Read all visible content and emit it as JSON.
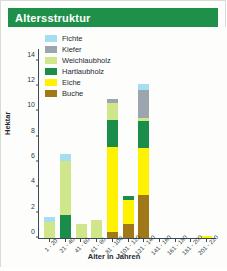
{
  "banner": {
    "title": "Altersstruktur"
  },
  "chart_data": {
    "type": "bar",
    "subtype": "stacked",
    "title": "Altersstruktur",
    "xlabel": "Alter in Jahren",
    "ylabel": "Hektar",
    "ylim": [
      0,
      15
    ],
    "yticks": [
      0,
      2,
      4,
      6,
      8,
      10,
      12,
      14
    ],
    "grid": false,
    "legend_position": "top-left-inside",
    "categories": [
      "1 - 20",
      "21 - 40",
      "41 - 60",
      "61 - 80",
      "81 - 100",
      "101 - 120",
      "121 - 140",
      "141 - 160",
      "161 - 180",
      "181 - 200",
      "201 - 220"
    ],
    "series": [
      {
        "name": "Buche",
        "color": "#a07818",
        "values": [
          0,
          0,
          0,
          0,
          0.5,
          1.1,
          3.4,
          0,
          0,
          0,
          0
        ]
      },
      {
        "name": "Eiche",
        "color": "#fff200",
        "values": [
          0,
          0,
          0,
          0,
          6.7,
          1.9,
          3.7,
          0,
          0,
          0,
          0.15
        ]
      },
      {
        "name": "Hartlaubholz",
        "color": "#1a8d4a",
        "values": [
          0,
          1.8,
          0,
          0,
          2.1,
          0.3,
          2.1,
          0,
          0,
          0,
          0
        ]
      },
      {
        "name": "Weichlaubholz",
        "color": "#cfe68a",
        "values": [
          1.3,
          4.3,
          1.1,
          1.4,
          1.4,
          0,
          0.3,
          0,
          0,
          0,
          0
        ]
      },
      {
        "name": "Kiefer",
        "color": "#9aa5ad",
        "values": [
          0,
          0,
          0,
          0,
          0.25,
          0,
          2.2,
          0,
          0,
          0,
          0
        ]
      },
      {
        "name": "Fichte",
        "color": "#a6ddf0",
        "values": [
          0.35,
          0.5,
          0,
          0,
          0,
          0,
          0.5,
          0,
          0,
          0,
          0
        ]
      }
    ],
    "totals": [
      1.65,
      6.6,
      1.1,
      1.4,
      10.95,
      3.3,
      12.2,
      0,
      0,
      0,
      0.15
    ]
  },
  "legend": {
    "items": [
      {
        "label": "Fichte",
        "color": "#a6ddf0"
      },
      {
        "label": "Kiefer",
        "color": "#9aa5ad"
      },
      {
        "label": "Weichlaubholz",
        "color": "#cfe68a"
      },
      {
        "label": "Hartlaubholz",
        "color": "#1a8d4a"
      },
      {
        "label": "Eiche",
        "color": "#fff200"
      },
      {
        "label": "Buche",
        "color": "#a07818"
      }
    ]
  },
  "colors": {
    "banner": "#1f9049",
    "axis": "#3a4a55",
    "background": "#fdfdfb"
  }
}
